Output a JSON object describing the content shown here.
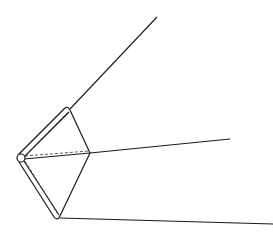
{
  "diagram": {
    "stroke_color": "#1a1a1a",
    "dash_color": "#444444",
    "background": "#ffffff",
    "pivot": {
      "cx": 21,
      "cy": 158,
      "r": 4
    },
    "vertices": {
      "top": [
        68,
        110
      ],
      "right": [
        90,
        153
      ],
      "bottom": [
        57,
        217
      ]
    },
    "rays": [
      {
        "name": "upper-ray",
        "from": [
          70,
          109
        ],
        "to": [
          157,
          17
        ]
      },
      {
        "name": "middle-ray",
        "from": [
          90,
          153
        ],
        "to": [
          230,
          139
        ]
      },
      {
        "name": "lower-ray",
        "from": [
          60,
          218
        ],
        "to": [
          273,
          224
        ]
      }
    ]
  }
}
